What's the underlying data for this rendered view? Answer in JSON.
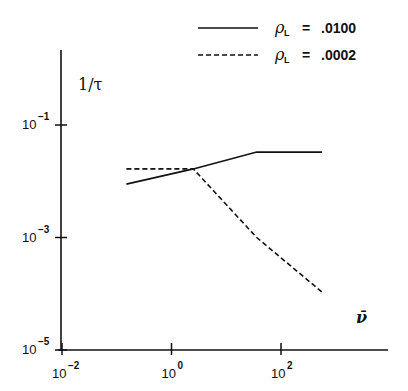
{
  "chart_data": {
    "type": "line",
    "title": "",
    "xlabel": "ν̄",
    "ylabel": "1/τ",
    "xscale": "log",
    "yscale": "log",
    "xlim": [
      0.01,
      10000
    ],
    "ylim": [
      1e-05,
      10
    ],
    "x_ticks": [
      {
        "base": "10",
        "exp": "−2",
        "value": 0.01
      },
      {
        "base": "10",
        "exp": "0",
        "value": 1
      },
      {
        "base": "10",
        "exp": "2",
        "value": 100
      }
    ],
    "y_ticks": [
      {
        "base": "10",
        "exp": "−1",
        "value": 0.1
      },
      {
        "base": "10",
        "exp": "−3",
        "value": 0.001
      },
      {
        "base": "10",
        "exp": "−5",
        "value": 1e-05
      }
    ],
    "grid": false,
    "legend_position": "top-right",
    "series": [
      {
        "name": "ρL = .0100",
        "symbol": "ρ",
        "subscript": "L",
        "value_label": ".0100",
        "style": "solid",
        "x": [
          0.15,
          2.5,
          36,
          560
        ],
        "y": [
          0.0089,
          0.0166,
          0.033,
          0.033
        ]
      },
      {
        "name": "ρL = .0002",
        "symbol": "ρ",
        "subscript": "L",
        "value_label": ".0002",
        "style": "dashed",
        "x": [
          0.15,
          2.5,
          36,
          560
        ],
        "y": [
          0.0166,
          0.0166,
          0.001,
          0.000107
        ]
      }
    ]
  },
  "labels": {
    "y_axis_title": "1/τ",
    "x_axis_title": "ν̄",
    "equals": "="
  }
}
